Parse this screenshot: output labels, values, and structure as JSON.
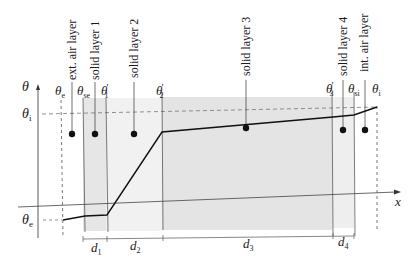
{
  "diagram": {
    "axes": {
      "y_label": "θ",
      "x_label": "x"
    },
    "level_labels": {
      "theta_i_left": "θ",
      "theta_i_left_sub": "i",
      "theta_e_left": "θ",
      "theta_e_left_sub": "e"
    },
    "interface_labels": [
      {
        "base": "θ",
        "sub": "e",
        "prime": ""
      },
      {
        "base": "θ",
        "sub": "se",
        "prime": ""
      },
      {
        "base": "θ",
        "sub": "1",
        "prime": "′"
      },
      {
        "base": "θ",
        "sub": "2",
        "prime": "′"
      },
      {
        "base": "θ",
        "sub": "3",
        "prime": "′"
      },
      {
        "base": "θ",
        "sub": "si",
        "prime": ""
      },
      {
        "base": "θ",
        "sub": "i",
        "prime": ""
      }
    ],
    "layer_labels": [
      "ext. air layer",
      "solid layer 1",
      "solid layer 2",
      "solid layer 3",
      "solid layer 4",
      "int. air layer"
    ],
    "thickness_labels": [
      {
        "base": "d",
        "sub": "1"
      },
      {
        "base": "d",
        "sub": "2"
      },
      {
        "base": "d",
        "sub": "3"
      },
      {
        "base": "d",
        "sub": "4"
      }
    ],
    "colors": {
      "shade_light": "#efefef",
      "shade_dark": "#e2e2e2",
      "line": "#222222"
    }
  }
}
